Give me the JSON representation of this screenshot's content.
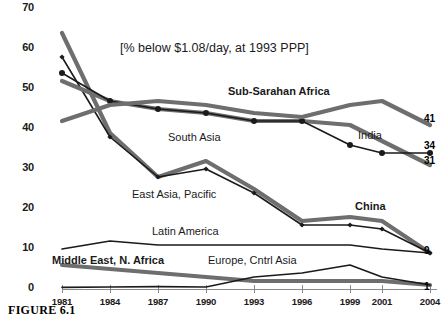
{
  "figure": {
    "caption": "FIGURE 6.1",
    "title": "[% below $1.08/day, at 1993 PPP]"
  },
  "chart_data": {
    "type": "line",
    "title": "[% below $1.08/day, at 1993 PPP]",
    "xlabel": "",
    "ylabel": "",
    "categories": [
      "1981",
      "1984",
      "1987",
      "1990",
      "1993",
      "1996",
      "1999",
      "2001",
      "2004"
    ],
    "ylim": [
      0,
      70
    ],
    "yticks": [
      0,
      10,
      20,
      30,
      40,
      50,
      60,
      70
    ],
    "grid": false,
    "legend": "inline-labels",
    "series": [
      {
        "name": "East Asia, Pacific",
        "color": "#6e6e6e",
        "style": "thick-gray",
        "markers": false,
        "label_x": 132,
        "label_y": 188,
        "bold": false,
        "values": [
          64,
          39,
          28,
          32,
          25,
          17,
          18,
          17,
          9
        ],
        "end_value": "9"
      },
      {
        "name": "China",
        "color": "#1a1a1a",
        "style": "thin-black-diamond",
        "markers": true,
        "label_x": 355,
        "label_y": 200,
        "bold": true,
        "values": [
          58,
          38,
          28,
          30,
          24,
          16,
          16,
          15,
          9
        ],
        "end_value": "9"
      },
      {
        "name": "South Asia",
        "color": "#6e6e6e",
        "style": "thick-gray",
        "markers": false,
        "label_x": 168,
        "label_y": 131,
        "bold": false,
        "values": [
          52,
          47,
          45,
          44,
          42,
          42,
          41,
          37,
          31
        ],
        "end_value": "31"
      },
      {
        "name": "India",
        "color": "#1a1a1a",
        "style": "thin-black-circle",
        "markers": true,
        "label_x": 358,
        "label_y": 129,
        "bold": false,
        "values": [
          54,
          47,
          45,
          44,
          42,
          42,
          36,
          34,
          34
        ],
        "end_value": "34"
      },
      {
        "name": "Sub-Sarahan Africa",
        "color": "#6e6e6e",
        "style": "thick-gray",
        "markers": false,
        "label_x": 228,
        "label_y": 85,
        "bold": true,
        "values": [
          42,
          46,
          47,
          46,
          44,
          43,
          46,
          47,
          41
        ],
        "end_value": "41"
      },
      {
        "name": "Latin America",
        "color": "#1a1a1a",
        "style": "thin-black",
        "markers": false,
        "label_x": 152,
        "label_y": 225,
        "bold": false,
        "values": [
          10,
          12,
          11,
          11,
          11,
          11,
          11,
          10,
          9
        ],
        "end_value": ""
      },
      {
        "name": "Middle East, N. Africa",
        "color": "#6e6e6e",
        "style": "thick-gray",
        "markers": false,
        "label_x": 52,
        "label_y": 254,
        "bold": true,
        "values": [
          6,
          5,
          4,
          3,
          2,
          2,
          2,
          2,
          1
        ],
        "end_value": "1"
      },
      {
        "name": "Europe, Cntrl Asia",
        "color": "#1a1a1a",
        "style": "thin-black",
        "markers": false,
        "label_x": 208,
        "label_y": 254,
        "bold": false,
        "values": [
          0.4,
          0.5,
          0.6,
          0.5,
          3,
          4,
          6,
          3,
          1
        ],
        "end_value": ""
      }
    ],
    "end_labels": [
      {
        "text": "41",
        "x": 424,
        "y": 113
      },
      {
        "text": "34",
        "x": 424,
        "y": 140
      },
      {
        "text": "31",
        "x": 424,
        "y": 155
      },
      {
        "text": "9",
        "x": 424,
        "y": 245
      },
      {
        "text": "1",
        "x": 424,
        "y": 281
      }
    ]
  }
}
